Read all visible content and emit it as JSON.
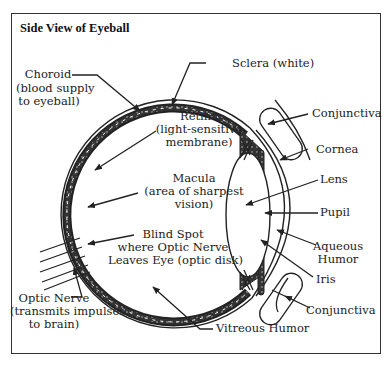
{
  "title": "Side View of Eyeball",
  "labels": {
    "choroid": {
      "name": "Choroid",
      "desc1": "(blood supply",
      "desc2": "to eyeball)"
    },
    "sclera": {
      "name": "Sclera (white)"
    },
    "retina": {
      "name": "Retina",
      "desc1": "(light-sensitive",
      "desc2": "membrane)"
    },
    "macula": {
      "name": "Macula",
      "desc1": "(area of sharpest",
      "desc2": "vision)"
    },
    "blind_spot": {
      "name": "Blind Spot",
      "desc1": "where Optic Nerve",
      "desc2": "Leaves Eye (optic disk)"
    },
    "optic_nerve": {
      "name": "Optic Nerve",
      "desc1": "(transmits impulses",
      "desc2": "to brain)"
    },
    "vitreous_humor": {
      "name": "Vitreous Humor"
    },
    "conjunctiva_top": {
      "name": "Conjunctiva"
    },
    "cornea": {
      "name": "Cornea"
    },
    "lens": {
      "name": "Lens"
    },
    "pupil": {
      "name": "Pupil"
    },
    "aqueous_humor": {
      "name": "Aqueous",
      "desc1": "Humor"
    },
    "iris": {
      "name": "Iris"
    },
    "conjunctiva_bottom": {
      "name": "Conjunctiva"
    }
  },
  "colors": {
    "ink": "#222222",
    "background": "#ffffff",
    "frame": "#333333"
  }
}
